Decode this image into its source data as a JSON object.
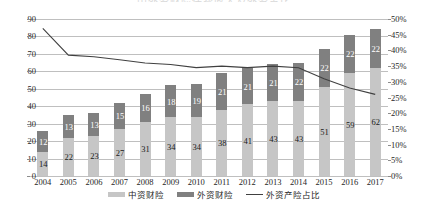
{
  "chart_data": {
    "type": "bar",
    "title": "中外资财险保费收入及外资占比",
    "categories": [
      "2004",
      "2005",
      "2006",
      "2007",
      "2008",
      "2009",
      "2010",
      "2011",
      "2012",
      "2013",
      "2014",
      "2015",
      "2016",
      "2017"
    ],
    "series": [
      {
        "name": "中资财险",
        "kind": "bar-stacked-bottom",
        "color": "#c6c6c6",
        "values": [
          14,
          22,
          23,
          27,
          31,
          34,
          34,
          38,
          41,
          43,
          43,
          51,
          59,
          62
        ]
      },
      {
        "name": "外资财险",
        "kind": "bar-stacked-top",
        "color": "#808080",
        "values": [
          12,
          13,
          13,
          15,
          16,
          18,
          19,
          21,
          21,
          21,
          22,
          22,
          22,
          22
        ]
      },
      {
        "name": "外资产险占比",
        "kind": "line",
        "axis": "secondary",
        "color": "#404040",
        "values": [
          47,
          38.5,
          38,
          37,
          36,
          35.5,
          34.5,
          35,
          34.5,
          35,
          34.5,
          31,
          28,
          26
        ]
      }
    ],
    "xlabel": "",
    "ylabel": "",
    "ylim": [
      0,
      90
    ],
    "yticks": [
      "0",
      "10",
      "20",
      "30",
      "40",
      "50",
      "60",
      "70",
      "80",
      "90"
    ],
    "y2lim": [
      0,
      50
    ],
    "y2ticks": [
      "0%",
      "5%",
      "10%",
      "15%",
      "20%",
      "25%",
      "30%",
      "35%",
      "40%",
      "45%",
      "50%"
    ],
    "grid": true,
    "legend_position": "bottom"
  },
  "legend": {
    "items": [
      {
        "label": "中资财险",
        "marker": "swatch",
        "color": "#c6c6c6"
      },
      {
        "label": "外资财险",
        "marker": "swatch",
        "color": "#808080"
      },
      {
        "label": "外资产险占比",
        "marker": "line",
        "color": "#404040"
      }
    ]
  }
}
